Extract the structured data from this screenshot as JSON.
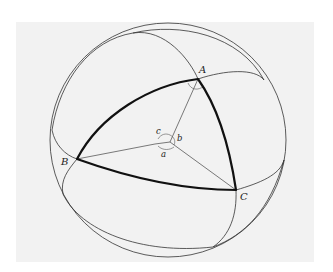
{
  "figure": {
    "vertices": {
      "A": {
        "label": "A"
      },
      "B": {
        "label": "B"
      },
      "C": {
        "label": "C"
      }
    },
    "center_angles": {
      "a": {
        "label": "a"
      },
      "b": {
        "label": "b"
      },
      "c": {
        "label": "c"
      }
    },
    "colors": {
      "background": "#f2f2f2",
      "stroke": "#111111",
      "page": "#ffffff"
    }
  }
}
